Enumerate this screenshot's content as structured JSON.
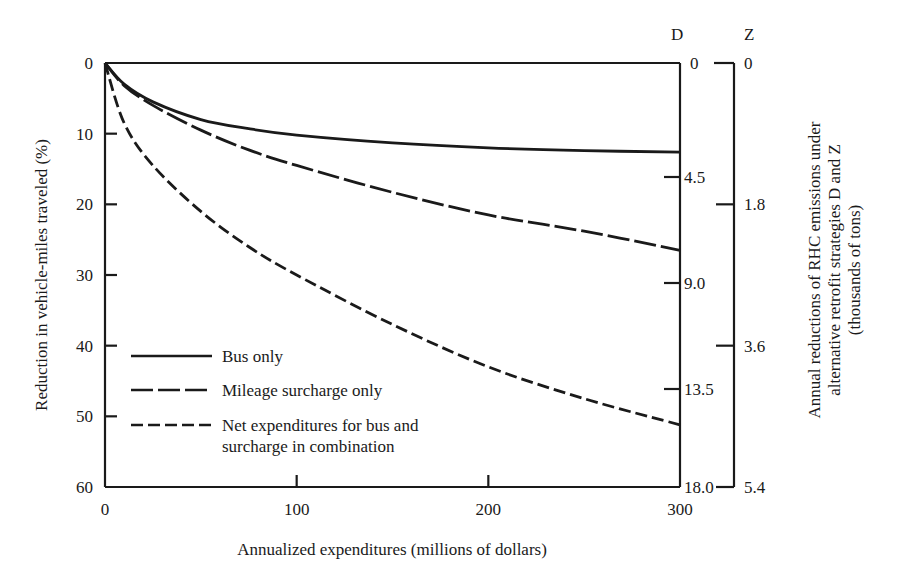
{
  "chart_data": {
    "type": "line",
    "title": "",
    "xlabel": "Annualized expenditures (millions of dollars)",
    "ylabel": "Reduction in vehicle-miles traveled (%)",
    "y2label_lines": [
      "Annual reductions of RHC emissions under",
      "alternative retrofit strategies D and Z",
      "(thousands of tons)"
    ],
    "xlim": [
      0,
      300
    ],
    "ylim": [
      0,
      60
    ],
    "y_inverted": true,
    "grid": false,
    "x_ticks": [
      "0",
      "100",
      "200",
      "300"
    ],
    "y_ticks": [
      "0",
      "10",
      "20",
      "30",
      "40",
      "50",
      "60"
    ],
    "axis_D": {
      "label": "D",
      "ticks": [
        "0",
        "4.5",
        "9.0",
        "13.5",
        "18.0"
      ],
      "range": [
        0,
        18.0
      ]
    },
    "axis_Z": {
      "label": "Z",
      "ticks": [
        "0",
        "1.8",
        "3.6",
        "5.4"
      ],
      "range": [
        0,
        5.4
      ]
    },
    "legend_position": "lower-left inside plot",
    "x": [
      0,
      10,
      25,
      50,
      75,
      100,
      150,
      200,
      250,
      300
    ],
    "series": [
      {
        "name": "Bus only",
        "style": "solid",
        "values": [
          0,
          3.0,
          5.5,
          8.0,
          9.3,
          10.2,
          11.3,
          12.0,
          12.4,
          12.6
        ]
      },
      {
        "name": "Mileage surcharge only",
        "style": "long-dash",
        "values": [
          0,
          3.2,
          6.0,
          9.5,
          12.3,
          14.5,
          18.3,
          21.5,
          23.8,
          26.5
        ]
      },
      {
        "name": "Net expenditures for bus and surcharge in combination",
        "style": "short-dash",
        "values": [
          0,
          8.5,
          14.5,
          21.0,
          26.0,
          30.0,
          37.0,
          43.0,
          47.5,
          51.2
        ]
      }
    ]
  },
  "legend": {
    "items": [
      {
        "label": "Bus only"
      },
      {
        "label": "Mileage surcharge only"
      },
      {
        "label_line1": "Net expenditures for bus and",
        "label_line2": "surcharge in combination"
      }
    ]
  }
}
